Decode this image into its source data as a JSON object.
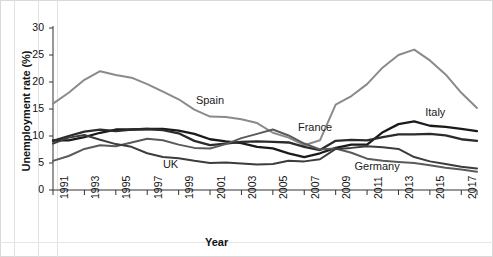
{
  "chart_data": {
    "type": "line",
    "title": "",
    "xlabel": "Year",
    "ylabel": "Unemployment rate (%)",
    "xlim": [
      1991,
      2018
    ],
    "ylim": [
      0,
      30
    ],
    "ytick_values": [
      0,
      5,
      10,
      15,
      20,
      25,
      30
    ],
    "ytick_labels": [
      "0",
      "5",
      "10",
      "15",
      "20",
      "25",
      "30"
    ],
    "xtick_values": [
      1991,
      1993,
      1995,
      1997,
      1999,
      2001,
      2003,
      2005,
      2007,
      2009,
      2011,
      2013,
      2015,
      2017
    ],
    "xtick_labels": [
      "1991",
      "1993",
      "1995",
      "1997",
      "1999",
      "2001",
      "2003",
      "2005",
      "2007",
      "2009",
      "2011",
      "2013",
      "2015",
      "2017"
    ],
    "grid": false,
    "legend_position": "inline-annotations",
    "x": [
      1991,
      1992,
      1993,
      1994,
      1995,
      1996,
      1997,
      1998,
      1999,
      2000,
      2001,
      2002,
      2003,
      2004,
      2005,
      2006,
      2007,
      2008,
      2009,
      2010,
      2011,
      2012,
      2013,
      2014,
      2015,
      2016,
      2017,
      2018
    ],
    "series": [
      {
        "name": "Spain",
        "color": "#8a8a8a",
        "width": 2.0,
        "label_x": 2000.1,
        "label_y": 16.4,
        "values": [
          16.0,
          18.0,
          20.4,
          22.0,
          21.3,
          20.8,
          19.6,
          18.2,
          16.8,
          14.9,
          13.6,
          13.5,
          13.1,
          12.4,
          10.6,
          9.7,
          8.3,
          9.2,
          15.8,
          17.4,
          19.6,
          22.7,
          25.0,
          26.0,
          24.0,
          21.4,
          18.0,
          15.2
        ]
      },
      {
        "name": "Italy",
        "color": "#1a1a1a",
        "width": 2.3,
        "label_x": 2014.7,
        "label_y": 14.3,
        "values": [
          9.2,
          9.2,
          9.8,
          10.6,
          11.2,
          11.2,
          11.3,
          11.3,
          11.0,
          10.4,
          9.4,
          9.0,
          8.7,
          8.0,
          7.7,
          6.8,
          6.1,
          6.8,
          7.8,
          8.4,
          8.4,
          10.7,
          12.2,
          12.7,
          11.9,
          11.7,
          11.3,
          10.9
        ]
      },
      {
        "name": "France",
        "color": "#2b2b2b",
        "width": 2.3,
        "label_x": 2006.6,
        "label_y": 11.5,
        "values": [
          9.1,
          10.0,
          10.8,
          11.2,
          10.9,
          11.2,
          11.3,
          11.1,
          10.5,
          9.1,
          8.3,
          8.6,
          8.9,
          9.0,
          8.9,
          8.8,
          8.0,
          7.4,
          9.1,
          9.3,
          9.2,
          9.8,
          10.3,
          10.3,
          10.4,
          10.1,
          9.4,
          9.1
        ]
      },
      {
        "name": "Germany",
        "color": "#5a5a5a",
        "width": 2.0,
        "label_x": 2010.2,
        "label_y": 4.2,
        "values": [
          5.4,
          6.3,
          7.6,
          8.3,
          8.1,
          8.8,
          9.5,
          9.2,
          8.4,
          7.8,
          7.7,
          8.5,
          9.6,
          10.4,
          11.2,
          10.1,
          8.6,
          7.5,
          7.7,
          6.9,
          5.8,
          5.4,
          5.2,
          5.0,
          4.6,
          4.1,
          3.8,
          3.4
        ]
      },
      {
        "name": "UK",
        "color": "#3c3c3c",
        "width": 2.0,
        "label_x": 1998.0,
        "label_y": 4.6,
        "values": [
          8.6,
          9.7,
          10.2,
          9.3,
          8.5,
          8.0,
          6.8,
          6.1,
          5.9,
          5.4,
          5.0,
          5.1,
          4.9,
          4.7,
          4.8,
          5.4,
          5.3,
          5.7,
          7.6,
          7.8,
          8.1,
          7.9,
          7.6,
          6.1,
          5.3,
          4.8,
          4.3,
          4.0
        ]
      }
    ]
  },
  "axis": {
    "ylabel": "Unemployment rate (%)",
    "xlabel": "Year"
  }
}
